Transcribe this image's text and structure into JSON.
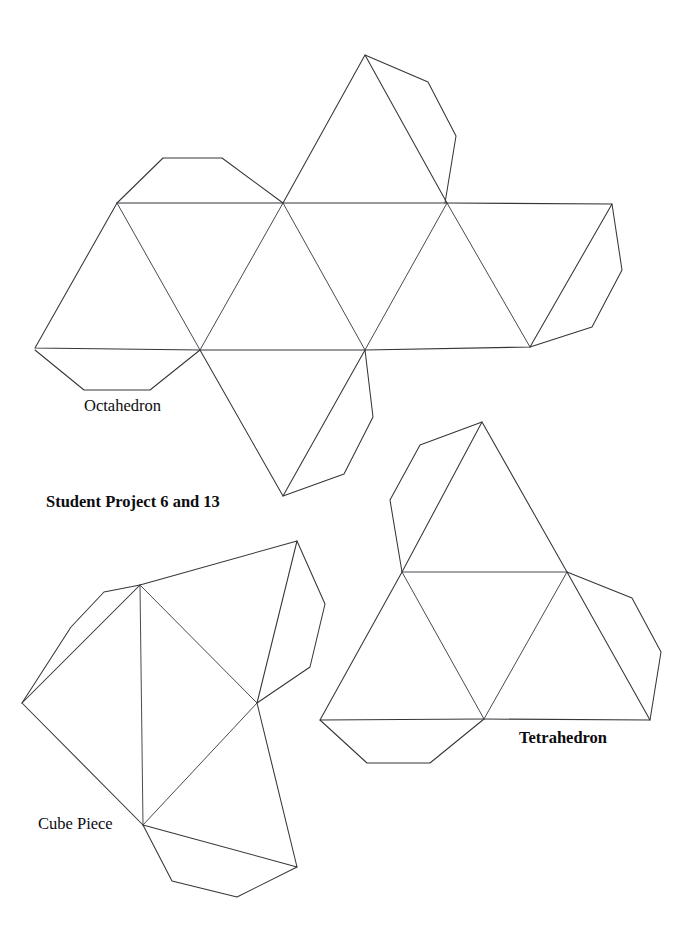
{
  "page": {
    "background_color": "#ffffff",
    "line_color": "#35353b",
    "width": 694,
    "height": 941
  },
  "labels": {
    "octahedron": "Octahedron",
    "project": "Student Project 6 and 13",
    "cube_piece": "Cube Piece",
    "tetrahedron": "Tetrahedron"
  },
  "diagram": {
    "type": "polyhedra-nets",
    "figures": [
      {
        "name": "octahedron",
        "label": "Octahedron",
        "faces": 6,
        "outline": "M 35 348 L 117 203 L 283 203 L 447 203 L 612 204 L 530 347 L 365 350 L 200 350 Z",
        "folds": [
          "M 117 203 L 200 350",
          "M 283 203 L 365 350",
          "M 447 203 L 530 347",
          "M 200 350 L 283 203",
          "M 365 350 L 447 203"
        ],
        "tabs": [
          "M 117 203 L 163 158 L 222 158 L 283 203",
          "M 365 55 L 428 82 L 456 136 L 445 203",
          "M 612 204 L 622 270 L 592 327 L 530 347",
          "M 35 350 L 84 390 L 150 390 L 200 350",
          "M 283 496 L 344 474 L 373 417 L 365 350"
        ],
        "extra_faces": [
          "M 283 203 L 365 55 L 447 203",
          "M 200 350 L 283 496 L 365 350"
        ]
      },
      {
        "name": "cube-piece",
        "label": "Cube Piece",
        "outline": "M 140 585 L 297 541 L 257 703 L 297 867 L 143 825 L 22 703 Z",
        "folds": [
          "M 140 585 L 143 825",
          "M 140 585 L 257 703",
          "M 143 825 L 257 703",
          "M 22 703 L 140 585"
        ],
        "tabs": [
          "M 140 585 L 104 592 L 71 627 L 22 703",
          "M 297 541 L 325 604 L 310 667 L 257 703",
          "M 143 825 L 172 881 L 237 897 L 297 867"
        ]
      },
      {
        "name": "tetrahedron",
        "label": "Tetrahedron",
        "faces": 4,
        "outline": "M 482 422 L 567 572 L 650 720 L 484 719 L 320 720 L 402 572 Z",
        "folds": [
          "M 402 572 L 567 572",
          "M 402 572 L 484 719",
          "M 567 572 L 484 719"
        ],
        "tabs": [
          "M 482 422 L 420 445 L 390 500 L 402 572",
          "M 567 572 L 632 598 L 661 652 L 650 720",
          "M 320 720 L 367 763 L 430 763 L 484 719"
        ]
      }
    ]
  }
}
